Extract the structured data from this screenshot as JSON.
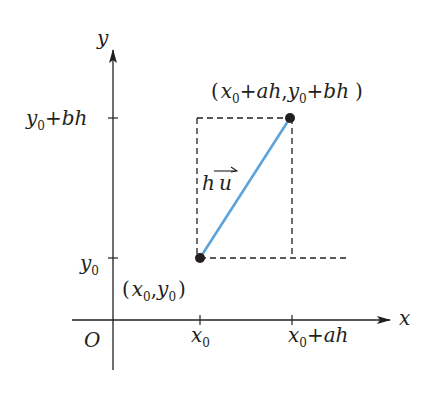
{
  "figure": {
    "axes": {
      "x_label": "x",
      "y_label": "y",
      "origin_label": "O"
    },
    "ticks": {
      "x0": {
        "base": "x",
        "sub": "0"
      },
      "x0_ah": {
        "base": "x",
        "sub": "0",
        "rest": "+ah"
      },
      "y0": {
        "base": "y",
        "sub": "0"
      },
      "y0_bh": {
        "base": "y",
        "sub": "0",
        "rest": "+bh"
      }
    },
    "points": {
      "start": {
        "label_open": "(",
        "label_x": "x",
        "label_xsub": "0",
        "label_comma": ",",
        "label_y": "y",
        "label_ysub": "0",
        "label_close": ")"
      },
      "end": {
        "label_open": "(",
        "label_x": "x",
        "label_xsub": "0",
        "label_xrest": "+ah",
        "label_comma": ",",
        "label_y": "y",
        "label_ysub": "0",
        "label_yrest": "+bh",
        "label_close": ")"
      }
    },
    "vector_label": {
      "scalar": "h",
      "vector": "u"
    },
    "colors": {
      "ink": "#231f20",
      "vector": "#5ba3dc"
    }
  }
}
